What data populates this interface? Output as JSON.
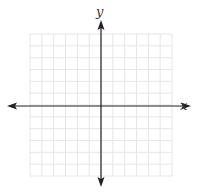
{
  "diagram": {
    "type": "coordinate-plane",
    "x_axis_label": "x",
    "y_axis_label": "y",
    "grid": {
      "columns": 12,
      "rows": 12,
      "left": 30,
      "top": 34,
      "right": 172,
      "bottom": 176
    },
    "origin": {
      "x": 101,
      "y": 106
    },
    "x_axis_extent": [
      7,
      191
    ],
    "y_axis_extent": [
      20,
      187
    ],
    "colors": {
      "grid": "#e6e6e6",
      "axis": "#222222",
      "label": "#333333",
      "background": "#ffffff"
    }
  }
}
